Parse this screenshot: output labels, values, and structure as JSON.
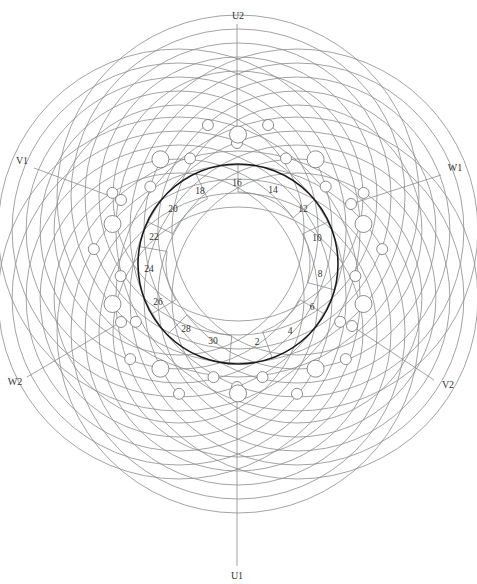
{
  "diagram": {
    "type": "three-phase stator winding diagram",
    "colors": {
      "wire": "#8c8c8c",
      "stator": "#1a1a1a",
      "terminal": "#6e6e6e",
      "text": "#333333",
      "background": "#ffffff"
    },
    "stator": {
      "cx": 238,
      "cy": 264,
      "r": 100
    },
    "terminals": [
      {
        "label": "U2",
        "x": 238,
        "y": 17,
        "anchor_x": 237,
        "anchor_y": 143
      },
      {
        "label": "U1",
        "x": 237,
        "y": 577,
        "anchor_x": 237,
        "anchor_y": 387
      },
      {
        "label": "V1",
        "x": 22,
        "y": 162,
        "anchor_x": 121,
        "anchor_y": 200
      },
      {
        "label": "W1",
        "x": 455,
        "y": 169,
        "anchor_x": 351,
        "anchor_y": 204
      },
      {
        "label": "W2",
        "x": 15,
        "y": 383,
        "anchor_x": 121,
        "anchor_y": 322
      },
      {
        "label": "V2",
        "x": 448,
        "y": 386,
        "anchor_x": 352,
        "anchor_y": 326
      }
    ],
    "slot_numbers": [
      {
        "label": "2",
        "x": 257,
        "y": 345
      },
      {
        "label": "4",
        "x": 290,
        "y": 334
      },
      {
        "label": "6",
        "x": 312,
        "y": 310
      },
      {
        "label": "8",
        "x": 320,
        "y": 277
      },
      {
        "label": "10",
        "x": 317,
        "y": 241
      },
      {
        "label": "12",
        "x": 303,
        "y": 212
      },
      {
        "label": "14",
        "x": 273,
        "y": 193
      },
      {
        "label": "16",
        "x": 237,
        "y": 186
      },
      {
        "label": "18",
        "x": 200,
        "y": 194
      },
      {
        "label": "20",
        "x": 173,
        "y": 212
      },
      {
        "label": "22",
        "x": 154,
        "y": 240
      },
      {
        "label": "24",
        "x": 149,
        "y": 272
      },
      {
        "label": "26",
        "x": 158,
        "y": 305
      },
      {
        "label": "28",
        "x": 186,
        "y": 332
      },
      {
        "label": "30",
        "x": 213,
        "y": 344
      }
    ]
  }
}
